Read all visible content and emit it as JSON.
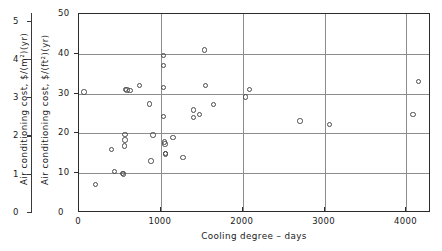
{
  "chart_data": {
    "type": "scatter",
    "title": "",
    "xlabel": "Cooling degree – days",
    "ylabel": "Air conditioning cost, $/(ft²)(yr)",
    "ylabel_secondary": "Air conditioning cost, $/(m²)(yr)",
    "xlim": [
      0,
      4300
    ],
    "ylim": [
      0,
      50
    ],
    "ylim_secondary": [
      0,
      5.2
    ],
    "xticks": [
      0,
      1000,
      2000,
      3000,
      4000
    ],
    "xticklabels": [
      "0",
      "1000",
      "2000",
      "3000",
      "4000"
    ],
    "yticks": [
      0,
      10,
      20,
      30,
      40,
      50
    ],
    "yticklabels": [
      "0",
      "10",
      "20",
      "30",
      "40",
      "50"
    ],
    "yticks_secondary": [
      0,
      1,
      2,
      3,
      4,
      5
    ],
    "yticklabels_secondary": [
      "0",
      "1",
      "2",
      "3",
      "4",
      "5"
    ],
    "grid": true,
    "grid_axes": "both",
    "legend": false,
    "marker": "open-circle",
    "marker_color": "#4a4a4a",
    "points": [
      {
        "x": 60,
        "y": 30.4
      },
      {
        "x": 205,
        "y": 7.2
      },
      {
        "x": 395,
        "y": 16.0
      },
      {
        "x": 430,
        "y": 10.5
      },
      {
        "x": 530,
        "y": 10.0
      },
      {
        "x": 545,
        "y": 9.8
      },
      {
        "x": 560,
        "y": 19.8
      },
      {
        "x": 560,
        "y": 18.3
      },
      {
        "x": 558,
        "y": 16.8
      },
      {
        "x": 570,
        "y": 31.0
      },
      {
        "x": 585,
        "y": 30.9
      },
      {
        "x": 625,
        "y": 30.8
      },
      {
        "x": 740,
        "y": 32.1
      },
      {
        "x": 860,
        "y": 27.4
      },
      {
        "x": 880,
        "y": 13.1
      },
      {
        "x": 905,
        "y": 19.6
      },
      {
        "x": 1035,
        "y": 39.5
      },
      {
        "x": 1035,
        "y": 37.1
      },
      {
        "x": 1030,
        "y": 31.6
      },
      {
        "x": 1035,
        "y": 24.2
      },
      {
        "x": 1045,
        "y": 17.8
      },
      {
        "x": 1050,
        "y": 17.3
      },
      {
        "x": 1055,
        "y": 15.0
      },
      {
        "x": 1060,
        "y": 14.8
      },
      {
        "x": 1150,
        "y": 19.0
      },
      {
        "x": 1270,
        "y": 14.0
      },
      {
        "x": 1400,
        "y": 25.9
      },
      {
        "x": 1395,
        "y": 24.0
      },
      {
        "x": 1470,
        "y": 24.8
      },
      {
        "x": 1530,
        "y": 41.0
      },
      {
        "x": 1545,
        "y": 32.1
      },
      {
        "x": 1640,
        "y": 27.2
      },
      {
        "x": 2035,
        "y": 29.1
      },
      {
        "x": 2085,
        "y": 31.0
      },
      {
        "x": 2700,
        "y": 23.1
      },
      {
        "x": 3060,
        "y": 22.2
      },
      {
        "x": 4080,
        "y": 24.8
      },
      {
        "x": 4150,
        "y": 33.1
      }
    ]
  },
  "axes": {
    "secondary": {
      "title": "Air conditioning cost, $/(m²)(yr)",
      "ticks": [
        {
          "label": "5",
          "value": 5
        },
        {
          "label": "4",
          "value": 4
        },
        {
          "label": "3",
          "value": 3
        },
        {
          "label": "2",
          "value": 2
        },
        {
          "label": "1",
          "value": 1
        },
        {
          "label": "0",
          "value": 0
        }
      ]
    },
    "primary_y": {
      "title": "Air conditioning cost, $/(ft²)(yr)",
      "ticks": [
        {
          "label": "50",
          "value": 50
        },
        {
          "label": "40",
          "value": 40
        },
        {
          "label": "30",
          "value": 30
        },
        {
          "label": "20",
          "value": 20
        },
        {
          "label": "10",
          "value": 10
        },
        {
          "label": "0",
          "value": 0
        }
      ]
    },
    "x": {
      "title": "Cooling degree – days",
      "ticks": [
        {
          "label": "0",
          "value": 0
        },
        {
          "label": "1000",
          "value": 1000
        },
        {
          "label": "2000",
          "value": 2000
        },
        {
          "label": "3000",
          "value": 3000
        },
        {
          "label": "4000",
          "value": 4000
        }
      ],
      "origin_label": "0"
    }
  }
}
